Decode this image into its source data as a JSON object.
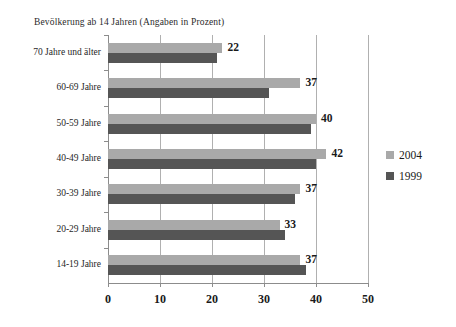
{
  "chart_data": {
    "type": "bar",
    "orientation": "horizontal",
    "title": "Bevölkerung ab 14 Jahren (Angaben in Prozent)",
    "xlabel": "",
    "ylabel": "",
    "xlim": [
      0,
      50
    ],
    "xticks": [
      0,
      10,
      20,
      30,
      40,
      50
    ],
    "xtick_labels": [
      "0",
      "10",
      "20",
      "30",
      "40",
      "50"
    ],
    "grid": true,
    "grid_axis": "x",
    "legend_position": "right",
    "categories": [
      "70 Jahre und älter",
      "60-69 Jahre",
      "50-59 Jahre",
      "40-49 Jahre",
      "30-39 Jahre",
      "20-29 Jahre",
      "14-19 Jahre"
    ],
    "series": [
      {
        "name": "2004",
        "color": "#a9a9a9",
        "values": [
          22,
          37,
          40,
          42,
          37,
          33,
          37
        ],
        "labels": [
          "22",
          "37",
          "40",
          "42",
          "37",
          "33",
          "37"
        ],
        "labels_shown": true
      },
      {
        "name": "1999",
        "color": "#555555",
        "values": [
          21,
          31,
          39,
          40,
          36,
          34,
          38
        ],
        "labels": [
          "21",
          "31",
          "39",
          "40",
          "36",
          "34",
          "38"
        ],
        "labels_shown": false
      }
    ]
  },
  "legend": {
    "items": [
      {
        "label": "2004",
        "color": "#a9a9a9"
      },
      {
        "label": "1999",
        "color": "#555555"
      }
    ]
  },
  "colors": {
    "series_2004": "#a9a9a9",
    "series_1999": "#555555",
    "gridline": "#b0b0b0",
    "axis": "#8c8c8c",
    "text": "#1a1a1a",
    "background": "#ffffff"
  }
}
